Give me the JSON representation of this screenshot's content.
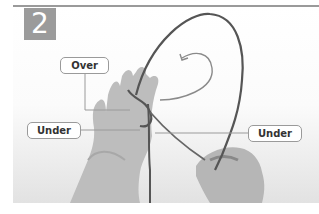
{
  "diagram": {
    "step_number": "2",
    "labels": {
      "over": "Over",
      "under_left": "Under",
      "under_right": "Under"
    },
    "colors": {
      "badge": "#9b9b9b",
      "rule": "#9a9a9a",
      "rope": "#555555",
      "arrow": "#8a8a8a",
      "skin": "#b8b8b8"
    }
  }
}
